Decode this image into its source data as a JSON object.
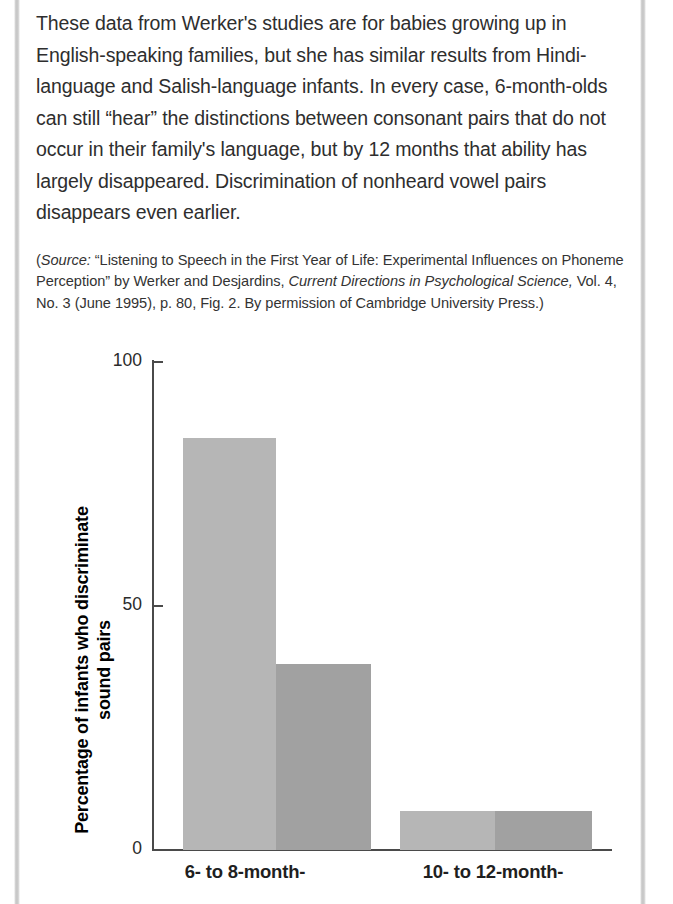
{
  "page": {
    "body_paragraph": "These data from Werker's studies are for babies growing up in English-speaking families, but she has similar results from Hindi-language and Salish-language infants. In every case, 6-month-olds can still “hear” the distinctions between consonant pairs that do not occur in their family's language, but by 12 months that ability has largely disappeared. Discrimination of nonheard vowel pairs disappears even earlier.",
    "source_note": {
      "open_paren": "(",
      "label_italic": "Source:",
      "text_1": " “Listening to Speech in the First Year of Life: Experimental Influences on Phoneme Perception” by Werker and Desjardins, ",
      "journal_italic": "Current Directions in Psychological Science,",
      "text_2": " Vol. 4, No. 3 (June 1995), p. 80, Fig. 2. By permission of Cambridge University Press.)"
    }
  },
  "chart_data": {
    "type": "bar",
    "title": "",
    "xlabel": "",
    "ylabel": "Percentage of infants who discriminate sound pairs",
    "ylim": [
      0,
      100
    ],
    "yticks": [
      0,
      50,
      100
    ],
    "ytick_labels": [
      "0",
      "50",
      "100"
    ],
    "grid": false,
    "legend": "none",
    "categories": [
      "6- to 8-month-",
      "10- to 12-month-"
    ],
    "series": [
      {
        "name": "heard sound pairs",
        "color": "#b6b6b6",
        "values": [
          84,
          8
        ]
      },
      {
        "name": "nonheard sound pairs",
        "color": "#a1a1a1",
        "values": [
          38,
          8
        ]
      }
    ],
    "bars": [
      {
        "group": "6- to 8-month-",
        "series": "heard sound pairs",
        "value": 84,
        "color": "#b6b6b6"
      },
      {
        "group": "6- to 8-month-",
        "series": "nonheard sound pairs",
        "value": 38,
        "color": "#a1a1a1"
      },
      {
        "group": "10- to 12-month-",
        "series": "heard sound pairs",
        "value": 8,
        "color": "#b6b6b6"
      },
      {
        "group": "10- to 12-month-",
        "series": "nonheard sound pairs",
        "value": 8,
        "color": "#a1a1a1"
      }
    ]
  }
}
